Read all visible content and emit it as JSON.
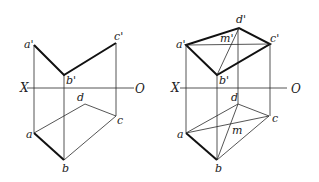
{
  "figures": [
    {
      "id": "left",
      "axis": {
        "left_label": "X",
        "right_label": "O"
      },
      "labels": {
        "a_prime": "a'",
        "b_prime": "b'",
        "c_prime": "c'",
        "a": "a",
        "b": "b",
        "c": "c",
        "d": "d"
      }
    },
    {
      "id": "right",
      "axis": {
        "left_label": "X",
        "right_label": "O"
      },
      "labels": {
        "a_prime": "a'",
        "b_prime": "b'",
        "c_prime": "c'",
        "d_prime": "d'",
        "m_prime": "m'",
        "a": "a",
        "b": "b",
        "c": "c",
        "d": "d",
        "m": "m"
      }
    }
  ]
}
